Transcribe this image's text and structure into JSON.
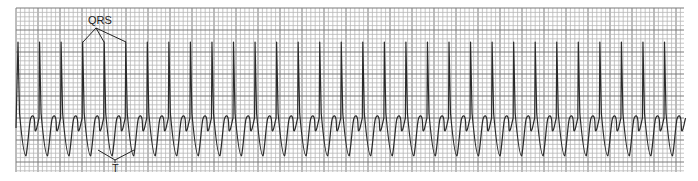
{
  "figure": {
    "type": "ECG rhythm strip",
    "grid": {
      "x0": 16,
      "y0": 8,
      "x1": 684,
      "y1": 172,
      "small_px": 4.4,
      "large_px": 22,
      "minor_color": "#b8b8b8",
      "major_color": "#7a7a7a"
    },
    "trace": {
      "color": "#2a2a2a",
      "first_spike_x": 18,
      "spacing_px": 21.55,
      "count": 31,
      "baseline_y": 118,
      "peak_y": 42,
      "trough_y": 156,
      "t_peak_y": 117
    },
    "annotations": {
      "qrs": {
        "text": "QRS",
        "x": 88,
        "y": 24,
        "targets_x": [
          83,
          104,
          126
        ],
        "origin": [
          96,
          28
        ],
        "target_y": 42
      },
      "t": {
        "text": "T",
        "x": 115,
        "y": 172,
        "targets_x": [
          98,
          134
        ],
        "origin": [
          115,
          160
        ],
        "target_y": 150
      }
    }
  }
}
